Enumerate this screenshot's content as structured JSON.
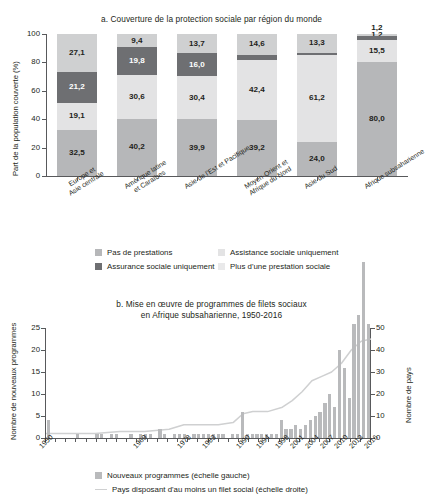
{
  "chart_data": [
    {
      "type": "bar",
      "id": "a",
      "title": "a. Couverture de la protection sociale par région du monde",
      "ylabel": "Part de la population couverte (%)",
      "xlabel": "",
      "ylim": [
        0,
        100
      ],
      "yticks": [
        0,
        20,
        40,
        60,
        80,
        100
      ],
      "stacked": true,
      "grid": false,
      "legend_position": "bottom",
      "categories": [
        "Europe et\nAsie centrale",
        "Amérique latine\net Caraïbes",
        "Asie de l'Est et Pacifique",
        "Moyen-Orient et\nAfrique du Nord",
        "Asie du Sud",
        "Afrique subsaharienne"
      ],
      "categories_lines": [
        [
          "Europe et",
          "Asie centrale"
        ],
        [
          "Amérique latine",
          "et Caraïbes"
        ],
        [
          "Asie de l'Est et Pacifique"
        ],
        [
          "Moyen-Orient et",
          "Afrique du Nord"
        ],
        [
          "Asie du Sud"
        ],
        [
          "Afrique subsaharienne"
        ]
      ],
      "series": [
        {
          "name": "Pas de prestations",
          "key": "s-none",
          "color": "#b6b7b9",
          "values": [
            32.5,
            40.2,
            39.9,
            39.2,
            24.0,
            80.0
          ]
        },
        {
          "name": "Assistance sociale uniquement",
          "key": "s-assist",
          "color": "#e3e3e4",
          "values": [
            19.1,
            30.6,
            30.4,
            42.4,
            61.2,
            15.5
          ]
        },
        {
          "name": "Assurance sociale uniquement",
          "key": "s-assur",
          "color": "#6e6f72",
          "values": [
            21.2,
            19.8,
            16.0,
            3.8,
            1.5,
            3.3
          ]
        },
        {
          "name": "Plus d'une prestation sociale",
          "key": "s-plus",
          "color": "#cfd0d1",
          "values": [
            27.1,
            9.4,
            13.7,
            14.6,
            13.3,
            1.2
          ]
        }
      ],
      "value_labels": {
        "bottom": [
          "32,5",
          "40,2",
          "39,9",
          "39,2",
          "24,0",
          "80,0"
        ],
        "assist": [
          "19,1",
          "30,6",
          "30,4",
          "42,4",
          "61,2",
          "15,5"
        ],
        "assur": [
          "21,2",
          "19,8",
          "16,0",
          "",
          "",
          ""
        ],
        "top": [
          "27,1",
          "9,4",
          "13,7",
          "14,6",
          "13,3",
          "1,2"
        ]
      },
      "legend": [
        {
          "label": "Pas de prestations",
          "key": "s-none"
        },
        {
          "label": "Assistance sociale uniquement",
          "key": "s-assist"
        },
        {
          "label": "Assurance sociale uniquement",
          "key": "s-assur"
        },
        {
          "label": "Plus d'une prestation sociale",
          "key": "s-plus"
        }
      ]
    },
    {
      "type": "bar",
      "id": "b",
      "title_line1": "b. Mise en œuvre de programmes de filets sociaux",
      "title_line2": "en Afrique subsaharienne, 1950-2016",
      "ylabel_left": "Nombre de nouveaux programmes",
      "ylabel_right": "Nombre de pays",
      "xlabel": "",
      "ylim_left": [
        0,
        25
      ],
      "yticks_left": [
        0,
        5,
        10,
        15,
        20,
        25
      ],
      "ylim_right": [
        0,
        50
      ],
      "yticks_right": [
        0,
        10,
        20,
        30,
        40,
        50
      ],
      "grid": false,
      "legend_position": "bottom",
      "xticks": [
        "1950",
        "1969",
        "1978",
        "1983",
        "1990",
        "1994",
        "1998",
        "2001",
        "2004",
        "2007",
        "2010",
        "2013",
        "2016"
      ],
      "xtick_years": [
        1950,
        1969,
        1978,
        1983,
        1990,
        1994,
        1998,
        2001,
        2004,
        2007,
        2010,
        2013,
        2016
      ],
      "x_start": 1950,
      "x_end": 2016,
      "series": [
        {
          "name": "Nouveaux programmes (échelle gauche)",
          "type": "bar",
          "axis": "left",
          "color": "#b9babc",
          "years": [
            1950,
            1951,
            1952,
            1953,
            1954,
            1955,
            1956,
            1957,
            1958,
            1959,
            1960,
            1961,
            1962,
            1963,
            1964,
            1965,
            1966,
            1967,
            1968,
            1969,
            1970,
            1971,
            1972,
            1973,
            1974,
            1975,
            1976,
            1977,
            1978,
            1979,
            1980,
            1981,
            1982,
            1983,
            1984,
            1985,
            1986,
            1987,
            1988,
            1989,
            1990,
            1991,
            1992,
            1993,
            1994,
            1995,
            1996,
            1997,
            1998,
            1999,
            2000,
            2001,
            2002,
            2003,
            2004,
            2005,
            2006,
            2007,
            2008,
            2009,
            2010,
            2011,
            2012,
            2013,
            2014,
            2015,
            2016
          ],
          "values": [
            4,
            0,
            0,
            0,
            0,
            0,
            1,
            0,
            0,
            0,
            1,
            1,
            0,
            1,
            1,
            0,
            0,
            1,
            0,
            1,
            1,
            1,
            0,
            2,
            1,
            0,
            1,
            1,
            1,
            0,
            1,
            1,
            1,
            1,
            1,
            1,
            1,
            0,
            1,
            1,
            6,
            1,
            1,
            1,
            1,
            1,
            1,
            1,
            4,
            2,
            2,
            3,
            2,
            3,
            4,
            5,
            6,
            8,
            10,
            7,
            20,
            16,
            9,
            26,
            28,
            40,
            26,
            16,
            8
          ]
        },
        {
          "name": "Pays disposant d'au moins un filet social (échelle droite)",
          "type": "line",
          "axis": "right",
          "color": "#cfd0d1",
          "years": [
            1950,
            1955,
            1960,
            1965,
            1970,
            1975,
            1978,
            1980,
            1983,
            1985,
            1988,
            1990,
            1992,
            1995,
            1998,
            2000,
            2002,
            2004,
            2006,
            2008,
            2010,
            2012,
            2014,
            2016
          ],
          "values": [
            2,
            2,
            2,
            3,
            3,
            4,
            6,
            6,
            6,
            6,
            7,
            11,
            12,
            12,
            14,
            17,
            21,
            26,
            28,
            30,
            34,
            40,
            44,
            45
          ]
        }
      ],
      "legend": [
        {
          "label": "Nouveaux programmes (échelle gauche)",
          "kind": "swatch",
          "color": "#b9babc"
        },
        {
          "label": "Pays disposant d'au moins un filet social (échelle droite)",
          "kind": "line",
          "color": "#cfd0d1"
        }
      ]
    }
  ]
}
